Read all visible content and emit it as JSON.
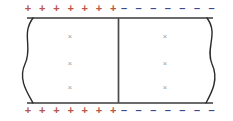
{
  "figure": {
    "name": "parallel-plate-capacitor-cross-section",
    "width": 233,
    "height": 121,
    "background_color": "#ffffff"
  },
  "colors": {
    "positive_charge": "#b5574a",
    "negative_charge": "#3a4a8c",
    "plate_line": "#3a3a3a",
    "break_line": "#2b2b2b",
    "divider_line": "#4a4a4a",
    "field_cross": "#9a9a9a"
  },
  "plates": {
    "top": {
      "label": "top-plate",
      "y_line": 18,
      "x_start": 27,
      "x_end": 213,
      "charge_row_y": 9,
      "segments": [
        {
          "name": "top-left-positive-segment",
          "sign": "+",
          "color_key": "positive_charge",
          "count": 7,
          "x_start": 28,
          "x_spacing": 14.2
        },
        {
          "name": "top-right-negative-segment",
          "sign": "–",
          "color_key": "negative_charge",
          "count": 7,
          "x_start": 124,
          "x_spacing": 14.6
        }
      ]
    },
    "bottom": {
      "label": "bottom-plate",
      "y_line": 103,
      "x_start": 27,
      "x_end": 213,
      "charge_row_y": 111,
      "segments": [
        {
          "name": "bottom-left-positive-segment",
          "sign": "+",
          "color_key": "positive_charge",
          "count": 7,
          "x_start": 28,
          "x_spacing": 14.2
        },
        {
          "name": "bottom-right-negative-segment",
          "sign": "–",
          "color_key": "negative_charge",
          "count": 7,
          "x_start": 124,
          "x_spacing": 14.6
        }
      ]
    }
  },
  "divider": {
    "name": "center-divider",
    "x": 118.5,
    "y_top": 18,
    "y_bottom": 103
  },
  "break_edges": [
    {
      "name": "left-break-line",
      "path": "M 33 18 C 21 34, 33 48, 25 64 C 18 79, 27 92, 33 103"
    },
    {
      "name": "right-break-line",
      "path": "M 207 18 C 219 34, 205 48, 212 64 C 219 79, 212 92, 206 103"
    }
  ],
  "field_markers": {
    "symbol": "×",
    "columns": [
      {
        "name": "left-region-field-column",
        "x": 70,
        "ys": [
          37,
          64,
          88
        ]
      },
      {
        "name": "right-region-field-column",
        "x": 165,
        "ys": [
          37,
          64,
          88
        ]
      }
    ]
  }
}
